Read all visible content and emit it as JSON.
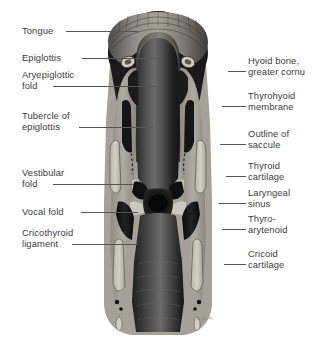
{
  "figure": {
    "signature": "A.H.W.",
    "palette": {
      "background": "#ffffff",
      "label_text": "#3b3b3b",
      "leader_line": "#555555",
      "airway_dark": "#141414",
      "cartilage_light": "#c9c5bd",
      "soft_tissue_mid": "#8e8b85",
      "mucosa_dark": "#3a3a3a",
      "muscle_black": "#111111",
      "highlight": "#ded9d1"
    }
  },
  "labels_left": [
    {
      "id": "tongue",
      "lines": [
        "Tongue"
      ],
      "x": 22,
      "y": 25,
      "leader": {
        "x": 66,
        "y": 31,
        "w": 72
      }
    },
    {
      "id": "epiglottis",
      "lines": [
        "Epiglottis"
      ],
      "x": 22,
      "y": 52,
      "leader": {
        "x": 82,
        "y": 58,
        "w": 80
      }
    },
    {
      "id": "aryepiglottic-fold",
      "lines": [
        "Aryepiglottic",
        "fold"
      ],
      "x": 22,
      "y": 69,
      "leader": {
        "x": 53,
        "y": 86,
        "w": 106
      }
    },
    {
      "id": "tubercle-epiglottis",
      "lines": [
        "Tubercle of",
        "epiglottis"
      ],
      "x": 22,
      "y": 110,
      "leader": {
        "x": 79,
        "y": 127,
        "w": 74
      }
    },
    {
      "id": "vestibular-fold",
      "lines": [
        "Vestibular",
        "fold"
      ],
      "x": 22,
      "y": 167,
      "leader": {
        "x": 53,
        "y": 184,
        "w": 81
      }
    },
    {
      "id": "vocal-fold",
      "lines": [
        "Vocal fold"
      ],
      "x": 22,
      "y": 206,
      "leader": {
        "x": 81,
        "y": 212,
        "w": 57
      }
    },
    {
      "id": "cricothyroid-ligament",
      "lines": [
        "Cricothyroid",
        "ligament"
      ],
      "x": 22,
      "y": 227,
      "leader": {
        "x": 72,
        "y": 244,
        "w": 66
      }
    }
  ],
  "labels_right": [
    {
      "id": "hyoid-bone",
      "lines": [
        "Hyoid bone,",
        "greater cornu"
      ],
      "x": 248,
      "y": 55,
      "leader": {
        "x": 228,
        "y": 71,
        "w": 18
      }
    },
    {
      "id": "thyrohyoid-membrane",
      "lines": [
        "Thyrohyoid",
        "membrane"
      ],
      "x": 248,
      "y": 90,
      "leader": {
        "x": 222,
        "y": 106,
        "w": 24
      }
    },
    {
      "id": "outline-of-saccule",
      "lines": [
        "Outline of",
        "saccule"
      ],
      "x": 248,
      "y": 128,
      "leader": {
        "x": 220,
        "y": 144,
        "w": 26
      }
    },
    {
      "id": "thyroid-cartilage",
      "lines": [
        "Thyroid",
        "cartilage"
      ],
      "x": 248,
      "y": 160,
      "leader": {
        "x": 226,
        "y": 176,
        "w": 20
      }
    },
    {
      "id": "laryngeal-sinus",
      "lines": [
        "Laryngeal",
        "sinus"
      ],
      "x": 248,
      "y": 187,
      "leader": {
        "x": 219,
        "y": 203,
        "w": 27
      }
    },
    {
      "id": "thyro-arytenoid",
      "lines": [
        "Thyro-",
        "arytenoid"
      ],
      "x": 248,
      "y": 213,
      "leader": {
        "x": 222,
        "y": 229,
        "w": 24
      }
    },
    {
      "id": "cricoid-cartilage",
      "lines": [
        "Cricoid",
        "cartilage"
      ],
      "x": 248,
      "y": 248,
      "leader": {
        "x": 224,
        "y": 264,
        "w": 22
      }
    }
  ]
}
